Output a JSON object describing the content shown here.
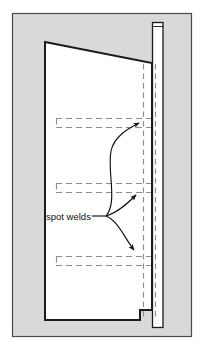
{
  "figure": {
    "caption_label": "spot welds",
    "background_color": "#ffffff",
    "frame_fill_color": "#d9d9d9",
    "frame_border_color": "#4a4a4a",
    "panel_fill_color": "#ffffff",
    "panel_outline_color": "#1a1a1a",
    "hidden_line_color": "#8d8d8d",
    "arrow_color": "#111111"
  },
  "frame": {
    "name": "illustration-frame",
    "x": 12,
    "y": 13,
    "width": 180,
    "height": 324
  },
  "panel": {
    "name": "sheet-metal-panel",
    "description": "large quadrilateral door panel with notched lower right corner",
    "outline_points": "45,42 152,63 152,310 140,310 140,320 45,320",
    "top_left": [
      45,
      42
    ],
    "top_right": [
      152,
      63
    ],
    "bottom_right": [
      152,
      310
    ],
    "bottom_left": [
      45,
      320
    ]
  },
  "post": {
    "name": "vertical-pillar",
    "description": "narrow vertical reinforcement post behind the panel edge",
    "x": 152,
    "y_top": 22,
    "y_bottom": 327,
    "width": 11
  },
  "hidden_lines": {
    "name": "hidden-edges",
    "vertical": [
      {
        "x": 143,
        "y1": 63,
        "y2": 318
      },
      {
        "x": 155,
        "y1": 63,
        "y2": 318
      }
    ],
    "flange_rows": [
      {
        "id": "weld-row-top",
        "y_upper": 118,
        "y_lower": 127,
        "x1": 56,
        "x2": 150
      },
      {
        "id": "weld-row-middle",
        "y_upper": 183,
        "y_lower": 192,
        "x1": 56,
        "x2": 150
      },
      {
        "id": "weld-row-bottom",
        "y_upper": 256,
        "y_lower": 265,
        "x1": 56,
        "x2": 150
      }
    ]
  },
  "leaders": {
    "name": "callout-leaders",
    "label": "spot welds",
    "label_x": 48,
    "label_y": 220,
    "anchor": [
      108,
      216
    ],
    "arrows": [
      {
        "id": "leader-to-top-weld",
        "path": "M108,216 C118,200 108,170 112,150 C115,138 128,130 140,124",
        "tip": [
          141,
          123
        ]
      },
      {
        "id": "leader-to-middle-weld",
        "path": "M108,216 C120,212 128,204 138,194",
        "tip": [
          139,
          193
        ]
      },
      {
        "id": "leader-to-bottom-weld",
        "path": "M108,216 C120,222 126,238 136,252",
        "tip": [
          137,
          253
        ]
      }
    ]
  },
  "legend": {
    "line_types": [
      {
        "name": "visible-outline",
        "style": "solid",
        "color": "#1a1a1a"
      },
      {
        "name": "hidden-outline",
        "style": "dashed",
        "color": "#8d8d8d"
      }
    ]
  }
}
